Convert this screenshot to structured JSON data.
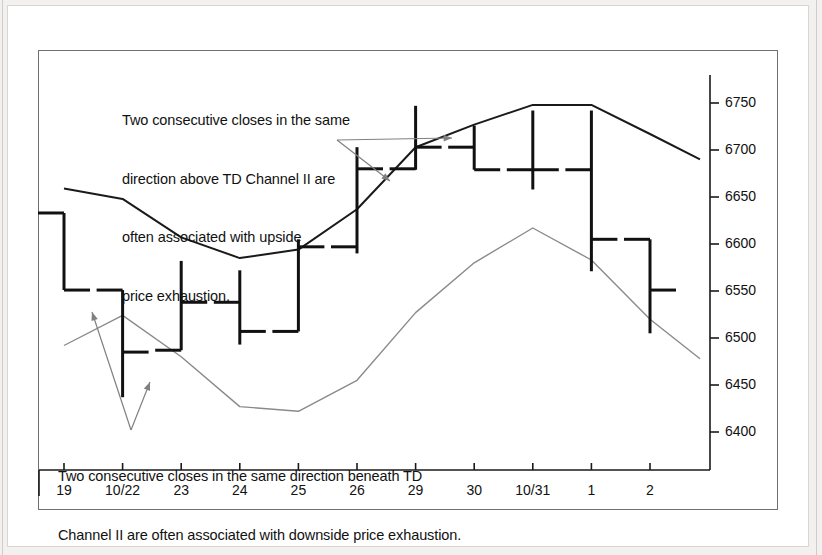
{
  "chart_data": {
    "type": "ohlc",
    "title": "",
    "xlabel": "",
    "ylabel": "",
    "ylim": [
      6370,
      6790
    ],
    "yticks": [
      6400,
      6450,
      6500,
      6550,
      6600,
      6650,
      6700,
      6750
    ],
    "grid": false,
    "categories": [
      "19",
      "10/22",
      "23",
      "24",
      "25",
      "26",
      "29",
      "30",
      "10/31",
      "1",
      "2"
    ],
    "bars": [
      {
        "date": "19",
        "high": 6633,
        "low": 6551,
        "open": 6633,
        "close": 6551
      },
      {
        "date": "10/22",
        "high": 6551,
        "low": 6437,
        "open": 6551,
        "close": 6485
      },
      {
        "date": "23",
        "high": 6582,
        "low": 6487,
        "open": 6487,
        "close": 6538
      },
      {
        "date": "24",
        "high": 6572,
        "low": 6493,
        "open": 6538,
        "close": 6507
      },
      {
        "date": "25",
        "high": 6605,
        "low": 6507,
        "open": 6507,
        "close": 6597
      },
      {
        "date": "26",
        "high": 6703,
        "low": 6590,
        "open": 6597,
        "close": 6680
      },
      {
        "date": "29",
        "high": 6747,
        "low": 6679,
        "open": 6680,
        "close": 6703
      },
      {
        "date": "30",
        "high": 6726,
        "low": 6679,
        "open": 6703,
        "close": 6679
      },
      {
        "date": "10/31",
        "high": 6742,
        "low": 6658,
        "open": 6679,
        "close": 6679
      },
      {
        "date": "1",
        "high": 6742,
        "low": 6571,
        "open": 6679,
        "close": 6605
      },
      {
        "date": "2",
        "high": 6605,
        "low": 6505,
        "open": 6605,
        "close": 6551
      }
    ],
    "series": [
      {
        "name": "TD Channel II upper",
        "color": "#1a1a1a",
        "points": [
          {
            "x": "19",
            "y": 6659
          },
          {
            "x": "10/22",
            "y": 6648
          },
          {
            "x": "23",
            "y": 6607
          },
          {
            "x": "24",
            "y": 6585
          },
          {
            "x": "25",
            "y": 6594
          },
          {
            "x": "26",
            "y": 6637
          },
          {
            "x": "29",
            "y": 6703
          },
          {
            "x": "30",
            "y": 6727
          },
          {
            "x": "10/31",
            "y": 6748
          },
          {
            "x": "1",
            "y": 6748
          },
          {
            "x": "2",
            "y": 6717
          },
          {
            "x": "end",
            "y": 6690
          }
        ]
      },
      {
        "name": "TD Channel II lower",
        "color": "#8a8a8a",
        "points": [
          {
            "x": "19",
            "y": 6492
          },
          {
            "x": "10/22",
            "y": 6524
          },
          {
            "x": "23",
            "y": 6480
          },
          {
            "x": "24",
            "y": 6427
          },
          {
            "x": "25",
            "y": 6422
          },
          {
            "x": "26",
            "y": 6455
          },
          {
            "x": "29",
            "y": 6527
          },
          {
            "x": "30",
            "y": 6580
          },
          {
            "x": "10/31",
            "y": 6617
          },
          {
            "x": "1",
            "y": 6583
          },
          {
            "x": "2",
            "y": 6520
          },
          {
            "x": "end",
            "y": 6478
          }
        ]
      }
    ],
    "annotations": [
      {
        "id": "upside",
        "text": "Two consecutive closes in the same\ndirection above TD Channel II are\noften associated with upside\nprice exhaustion.",
        "points_to": [
          "29",
          "26"
        ]
      },
      {
        "id": "downside",
        "text": "Two consecutive closes in the same direction beneath TD\nChannel II are often associated with downside price exhaustion.",
        "points_to": [
          "19",
          "10/22"
        ]
      }
    ]
  },
  "axis": {
    "y_ticks": [
      "6750",
      "6700",
      "6650",
      "6600",
      "6550",
      "6500",
      "6450",
      "6400"
    ],
    "x_ticks": [
      "19",
      "10/22",
      "23",
      "24",
      "25",
      "26",
      "29",
      "30",
      "10/31",
      "1",
      "2"
    ]
  },
  "annotations": {
    "top": {
      "line1": "Two consecutive closes in the same",
      "line2": "direction above TD Channel II are",
      "line3": "often associated with upside",
      "line4": "price exhaustion."
    },
    "bottom": {
      "line1": "Two consecutive closes in the same direction beneath TD",
      "line2": "Channel II are often associated with downside price exhaustion."
    }
  },
  "colors": {
    "upper_channel": "#1a1a1a",
    "lower_channel": "#8a8a8a",
    "bar": "#111111",
    "arrow": "#808080",
    "axis": "#1a1a1a",
    "frame": "#6f6f6f",
    "page_background": "#f2f1ef"
  }
}
